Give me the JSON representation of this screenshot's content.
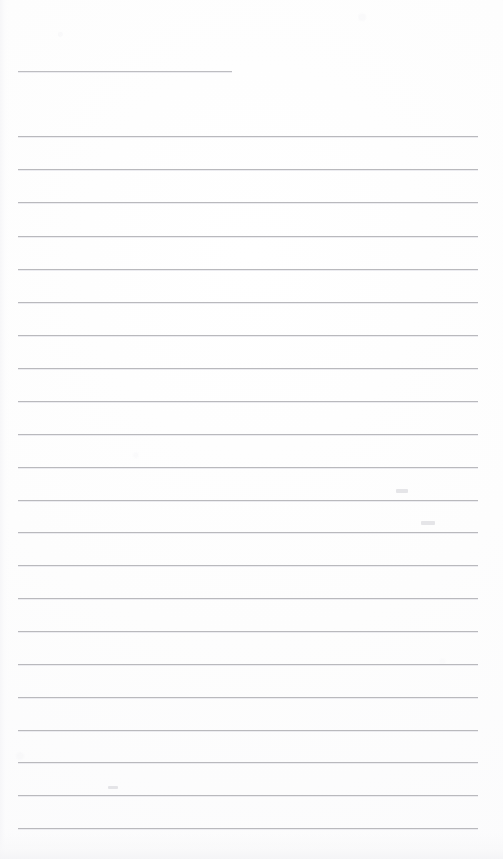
{
  "document": {
    "kind": "scanned-lined-notebook-page",
    "page_title": "",
    "body_text": "",
    "background_color": "#fdfdfd",
    "rule_color": "#b9b9bd",
    "page_width": 503,
    "page_height": 859
  },
  "header_rule": {
    "name": "title-underline",
    "x": 18,
    "y": 71,
    "width": 214
  },
  "ruled_lines": [
    {
      "index": 1,
      "y": 136,
      "x": 18,
      "width": 460
    },
    {
      "index": 2,
      "y": 169,
      "x": 18,
      "width": 460
    },
    {
      "index": 3,
      "y": 202,
      "x": 18,
      "width": 460
    },
    {
      "index": 4,
      "y": 236,
      "x": 18,
      "width": 460
    },
    {
      "index": 5,
      "y": 269,
      "x": 18,
      "width": 460
    },
    {
      "index": 6,
      "y": 302,
      "x": 18,
      "width": 460
    },
    {
      "index": 7,
      "y": 335,
      "x": 18,
      "width": 460
    },
    {
      "index": 8,
      "y": 368,
      "x": 18,
      "width": 460
    },
    {
      "index": 9,
      "y": 401,
      "x": 18,
      "width": 460
    },
    {
      "index": 10,
      "y": 434,
      "x": 18,
      "width": 460
    },
    {
      "index": 11,
      "y": 467,
      "x": 18,
      "width": 460
    },
    {
      "index": 12,
      "y": 500,
      "x": 18,
      "width": 460
    },
    {
      "index": 13,
      "y": 532,
      "x": 18,
      "width": 460
    },
    {
      "index": 14,
      "y": 565,
      "x": 18,
      "width": 460
    },
    {
      "index": 15,
      "y": 598,
      "x": 18,
      "width": 460
    },
    {
      "index": 16,
      "y": 631,
      "x": 18,
      "width": 460
    },
    {
      "index": 17,
      "y": 664,
      "x": 18,
      "width": 460
    },
    {
      "index": 18,
      "y": 697,
      "x": 18,
      "width": 460
    },
    {
      "index": 19,
      "y": 730,
      "x": 18,
      "width": 460
    },
    {
      "index": 20,
      "y": 762,
      "x": 18,
      "width": 460
    },
    {
      "index": 21,
      "y": 795,
      "x": 18,
      "width": 460
    },
    {
      "index": 22,
      "y": 828,
      "x": 18,
      "width": 460
    }
  ],
  "smudges": [
    {
      "name": "pencil-smudge-right-upper",
      "x": 396,
      "y": 489,
      "width": 12,
      "height": 4
    },
    {
      "name": "pencil-smudge-right-lower",
      "x": 421,
      "y": 521,
      "width": 14,
      "height": 4
    },
    {
      "name": "pencil-smudge-mid-lower",
      "x": 108,
      "y": 786,
      "width": 10,
      "height": 3
    }
  ]
}
